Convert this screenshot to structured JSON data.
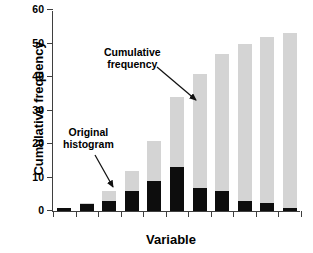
{
  "chart_data": {
    "type": "bar",
    "title": "",
    "subtitle": "",
    "xlabel": "Variable",
    "ylabel": "Cumulative frequency",
    "ylim": [
      0,
      60
    ],
    "yticks": [
      0,
      10,
      20,
      30,
      40,
      50,
      60
    ],
    "ytick_labels": [
      "0",
      "10",
      "20",
      "30",
      "40",
      "50",
      "60"
    ],
    "grid": false,
    "legend_position": "none",
    "stacked": true,
    "categories": [
      "1",
      "2",
      "3",
      "4",
      "5",
      "6",
      "7",
      "8",
      "9",
      "10",
      "11"
    ],
    "series": [
      {
        "name": "Cumulative frequency",
        "color": "#d4d4d4",
        "values": [
          1,
          2.5,
          6,
          12,
          21,
          34,
          41,
          47,
          50,
          52,
          53
        ]
      },
      {
        "name": "Original histogram",
        "color": "#0d0d0d",
        "values": [
          1,
          2,
          3,
          6,
          9,
          13,
          7,
          6,
          3,
          2.5,
          1
        ]
      }
    ],
    "annotations": [
      {
        "id": "cumulative-frequency",
        "text_line1": "Cumulative",
        "text_line2": "frequency",
        "points_to_category": "7"
      },
      {
        "id": "original-histogram",
        "text_line1": "Original",
        "text_line2": "histogram",
        "points_to_category": "4"
      }
    ]
  }
}
